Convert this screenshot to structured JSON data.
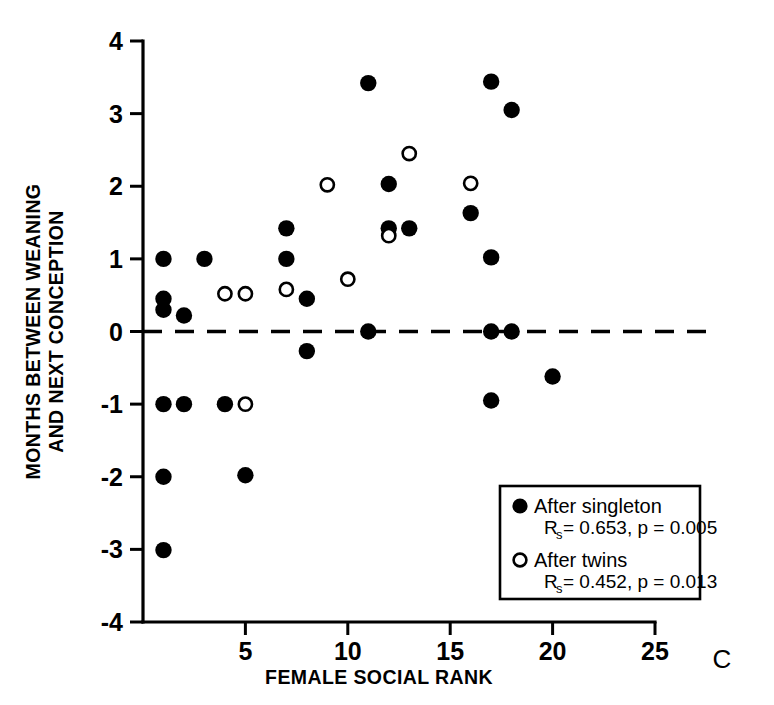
{
  "chart_data": {
    "type": "scatter",
    "title": "",
    "panel_label": "C",
    "xlabel": "FEMALE SOCIAL RANK",
    "ylabel_lines": [
      "MONTHS BETWEEN WEANING",
      "AND NEXT CONCEPTION"
    ],
    "xlim": [
      0,
      25
    ],
    "ylim": [
      -4,
      4
    ],
    "xticks": [
      0,
      5,
      10,
      15,
      20,
      25
    ],
    "xtick_labels": [
      "",
      "5",
      "10",
      "15",
      "20",
      "25"
    ],
    "yticks": [
      -4,
      -3,
      -2,
      -1,
      0,
      1,
      2,
      3,
      4
    ],
    "ytick_labels": [
      "-4",
      "-3",
      "-2",
      "-1",
      "0",
      "1",
      "2",
      "3",
      "4"
    ],
    "grid": false,
    "reference_line": {
      "y": 0,
      "style": "dashed"
    },
    "legend_position": "bottom-right",
    "series": [
      {
        "name": "After singleton",
        "marker": "filled-circle",
        "color": "#000000",
        "stat_label": "R",
        "stat_sub": "s",
        "stat_text": "= 0.653, p = 0.005",
        "rs": 0.653,
        "p": 0.005,
        "points": [
          [
            1,
            1.0
          ],
          [
            1,
            0.45
          ],
          [
            1,
            0.3
          ],
          [
            1,
            -1.0
          ],
          [
            1,
            -2.0
          ],
          [
            1,
            -3.01
          ],
          [
            2,
            0.22
          ],
          [
            2,
            -1.0
          ],
          [
            3,
            1.0
          ],
          [
            4,
            -1.0
          ],
          [
            5,
            -1.98
          ],
          [
            7,
            1.42
          ],
          [
            7,
            1.0
          ],
          [
            8,
            0.45
          ],
          [
            8,
            -0.27
          ],
          [
            11,
            3.42
          ],
          [
            11,
            0.0
          ],
          [
            12,
            2.03
          ],
          [
            12,
            1.42
          ],
          [
            13,
            1.42
          ],
          [
            16,
            1.63
          ],
          [
            17,
            3.44
          ],
          [
            17,
            1.02
          ],
          [
            17,
            0.0
          ],
          [
            17,
            -0.95
          ],
          [
            18,
            3.05
          ],
          [
            18,
            0.0
          ],
          [
            20,
            -0.62
          ]
        ]
      },
      {
        "name": "After twins",
        "marker": "open-circle",
        "color": "#000000",
        "stat_label": "R",
        "stat_sub": "s",
        "stat_text": "= 0.452, p = 0.013",
        "rs": 0.452,
        "p": 0.013,
        "points": [
          [
            4,
            0.52
          ],
          [
            5,
            0.52
          ],
          [
            5,
            -1.0
          ],
          [
            7,
            0.58
          ],
          [
            9,
            2.02
          ],
          [
            10,
            0.72
          ],
          [
            12,
            1.32
          ],
          [
            13,
            2.45
          ],
          [
            16,
            2.04
          ]
        ]
      }
    ]
  },
  "axes": {
    "x_axis_name": "x-axis",
    "y_axis_name": "y-axis"
  }
}
